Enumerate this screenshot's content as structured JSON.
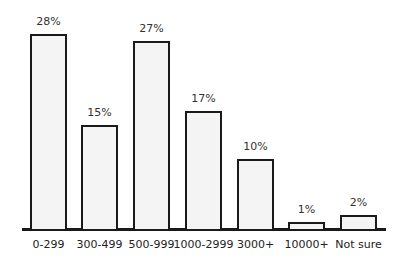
{
  "chart_data": {
    "type": "bar",
    "title": "",
    "xlabel": "",
    "ylabel": "",
    "categories": [
      "0-299",
      "300-499",
      "500-999",
      "1000-2999",
      "3000+",
      "10000+",
      "Not sure"
    ],
    "values": [
      28,
      15,
      27,
      17,
      10,
      1,
      2
    ],
    "value_labels": [
      "28%",
      "15%",
      "27%",
      "17%",
      "10%",
      "1%",
      "2%"
    ],
    "unit": "%",
    "ylim": [
      0,
      28
    ],
    "grid": false,
    "legend": null,
    "bar_fill": "#f4f4f4",
    "bar_edge": "#1a1a1a"
  }
}
